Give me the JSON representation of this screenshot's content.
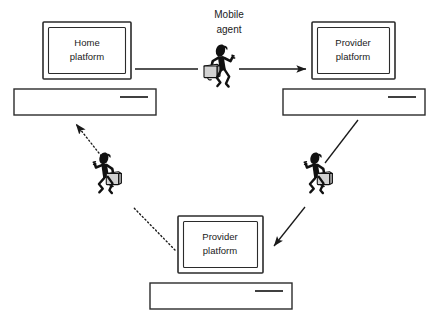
{
  "diagram": {
    "background_color": "#ffffff",
    "line_color": "#1a1a1a",
    "case_color": "#d2d2d2",
    "figure_color": "#111111",
    "nodes": [
      {
        "id": "home-platform",
        "label_line1": "Home",
        "label_line2": "platform",
        "position": "top-left",
        "x": 43,
        "y": 22,
        "width": 88,
        "height": 57
      },
      {
        "id": "provider-platform-right",
        "label_line1": "Provider",
        "label_line2": "platform",
        "position": "top-right",
        "x": 312,
        "y": 22,
        "width": 83,
        "height": 57
      },
      {
        "id": "provider-platform-bottom",
        "label_line1": "Provider",
        "label_line2": "platform",
        "position": "bottom-center",
        "x": 178,
        "y": 216,
        "width": 85,
        "height": 57
      }
    ],
    "agents": [
      {
        "id": "mobile-agent-top",
        "caption_line1": "Mobile",
        "caption_line2": "agent",
        "has_caption": true,
        "position": "top-center"
      },
      {
        "id": "mobile-agent-right",
        "caption_line1": "",
        "caption_line2": "",
        "has_caption": false,
        "position": "middle-right"
      },
      {
        "id": "mobile-agent-left",
        "caption_line1": "",
        "caption_line2": "",
        "has_caption": false,
        "position": "middle-left"
      }
    ],
    "connections": [
      {
        "id": "home-to-agent",
        "from": "home-platform",
        "to": "mobile-agent-top",
        "style": "solid",
        "arrowhead": false
      },
      {
        "id": "agent-to-provider-right",
        "from": "mobile-agent-top",
        "to": "provider-platform-right",
        "style": "solid",
        "arrowhead": true
      },
      {
        "id": "provider-right-to-agent-right",
        "from": "provider-platform-right",
        "to": "mobile-agent-right",
        "style": "solid",
        "arrowhead": false
      },
      {
        "id": "agent-right-to-provider-bottom",
        "from": "mobile-agent-right",
        "to": "provider-platform-bottom",
        "style": "solid",
        "arrowhead": true
      },
      {
        "id": "provider-bottom-to-agent-left",
        "from": "provider-platform-bottom",
        "to": "mobile-agent-left",
        "style": "dotted",
        "arrowhead": false
      },
      {
        "id": "agent-left-to-home",
        "from": "mobile-agent-left",
        "to": "home-platform",
        "style": "dotted",
        "arrowhead": true
      }
    ]
  }
}
